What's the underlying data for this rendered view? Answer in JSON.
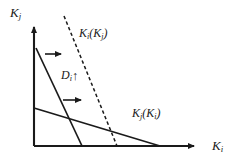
{
  "figure": {
    "background_color": "#ffffff",
    "ink_color": "#1a1a1a"
  },
  "axes": {
    "y_label_base": "K",
    "y_label_sub": "j",
    "x_label_base": "K",
    "x_label_sub": "i",
    "origin": {
      "x": 34,
      "y": 146
    },
    "y_tip": {
      "x": 34,
      "y": 24
    },
    "x_tip": {
      "x": 200,
      "y": 146
    }
  },
  "curves": [
    {
      "name": "reaction-function-i-initial",
      "label_base": "K",
      "label_sub": "i",
      "label_arg_base": "K",
      "label_arg_sub": "j",
      "style": "solid",
      "start": {
        "x": 36,
        "y": 48
      },
      "end": {
        "x": 82,
        "y": 146
      }
    },
    {
      "name": "reaction-function-i-shifted",
      "label_base": "K",
      "label_sub": "i",
      "label_arg_base": "K",
      "label_arg_sub": "j",
      "style": "dashed",
      "start": {
        "x": 64,
        "y": 16
      },
      "end": {
        "x": 117,
        "y": 146
      }
    },
    {
      "name": "reaction-function-j",
      "label_base": "K",
      "label_sub": "j",
      "label_arg_base": "K",
      "label_arg_sub": "i",
      "style": "solid",
      "start": {
        "x": 34,
        "y": 108
      },
      "end": {
        "x": 160,
        "y": 146
      }
    }
  ],
  "labels": {
    "curve_i": {
      "base": "K",
      "sub": "i",
      "arg_base": "K",
      "arg_sub": "j"
    },
    "curve_j": {
      "base": "K",
      "sub": "j",
      "arg_base": "K",
      "arg_sub": "i"
    },
    "demand_shift": {
      "base": "D",
      "sub": "i",
      "arrow": "↑"
    }
  },
  "shift_arrows": [
    {
      "name": "shift-arrow-upper",
      "from": {
        "x": 45,
        "y": 54
      },
      "to": {
        "x": 66,
        "y": 54
      }
    },
    {
      "name": "shift-arrow-lower",
      "from": {
        "x": 63,
        "y": 100
      },
      "to": {
        "x": 86,
        "y": 100
      }
    }
  ]
}
